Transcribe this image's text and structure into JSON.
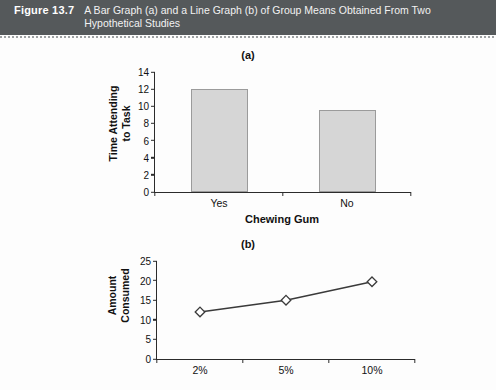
{
  "banner": {
    "figure_number": "Figure 13.7",
    "caption": "A Bar Graph (a) and a Line Graph (b) of Group Means Obtained From Two Hypothetical Studies",
    "background_color": "#55595b",
    "text_color": "#ffffff"
  },
  "panels": {
    "a_label": "(a)",
    "b_label": "(b)"
  },
  "chart_data": [
    {
      "type": "bar",
      "panel": "(a)",
      "title": "",
      "categories": [
        "Yes",
        "No"
      ],
      "values": [
        12.0,
        9.6
      ],
      "xlabel": "Chewing Gum",
      "ylabel": "Time Attending to Task",
      "ylabel_lines": [
        "Time Attending",
        "to Task"
      ],
      "ylim": [
        0,
        14
      ],
      "yticks": [
        0,
        2,
        4,
        6,
        8,
        10,
        12,
        14
      ],
      "ytick_labels": [
        "0",
        "2",
        "4",
        "6",
        "8",
        "10",
        "12",
        "14"
      ],
      "grid": false,
      "legend": "none",
      "bar_fill_color": "#d6d6d6",
      "bar_edge_color": "#9b9b9b"
    },
    {
      "type": "line",
      "panel": "(b)",
      "title": "",
      "categories": [
        "2%",
        "5%",
        "10%"
      ],
      "values": [
        12.0,
        15.0,
        19.7
      ],
      "xlabel": "",
      "ylabel": "Amount Consumed",
      "ylabel_lines": [
        "Amount",
        "Consumed"
      ],
      "ylim": [
        0,
        25
      ],
      "yticks": [
        0,
        5,
        10,
        15,
        20,
        25
      ],
      "ytick_labels": [
        "0",
        "5",
        "10",
        "15",
        "20",
        "25"
      ],
      "grid": false,
      "legend": "none",
      "marker": "open-diamond",
      "line_color": "#3a3a3a",
      "marker_fill_color": "#ffffff"
    }
  ]
}
